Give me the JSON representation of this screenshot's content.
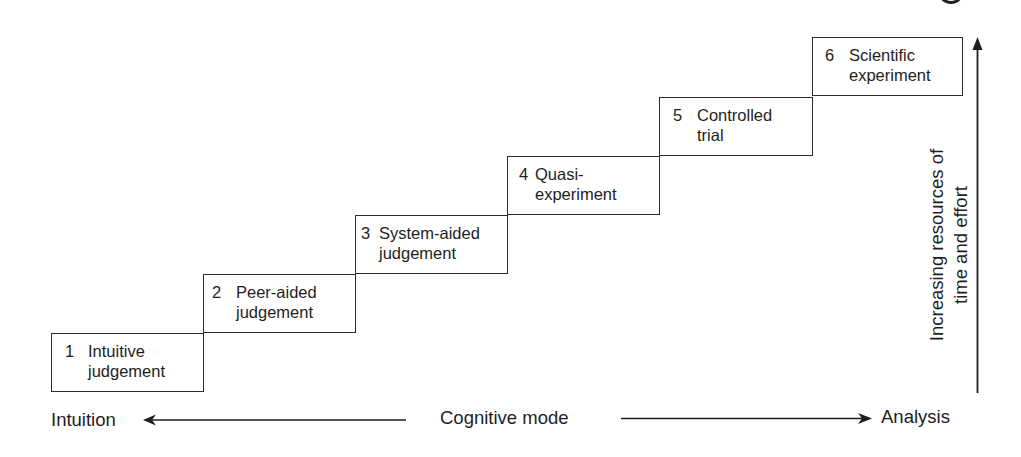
{
  "diagram": {
    "type": "staircase",
    "steps": [
      {
        "number": "1",
        "label": "Intuitive\njudgement"
      },
      {
        "number": "2",
        "label": "Peer-aided\njudgement"
      },
      {
        "number": "3",
        "label": "System-aided\njudgement"
      },
      {
        "number": "4",
        "label": "Quasi-\nexperiment"
      },
      {
        "number": "5",
        "label": "Controlled\ntrial"
      },
      {
        "number": "6",
        "label": "Scientific\nexperiment"
      }
    ],
    "horizontal_axis": {
      "left_label": "Intuition",
      "center_label": "Cognitive mode",
      "right_label": "Analysis"
    },
    "vertical_axis": {
      "label": "Increasing resources of\ntime and effort"
    },
    "colors": {
      "line": "#2a2a2a",
      "text": "#1e1e1e",
      "background": "#ffffff"
    }
  }
}
